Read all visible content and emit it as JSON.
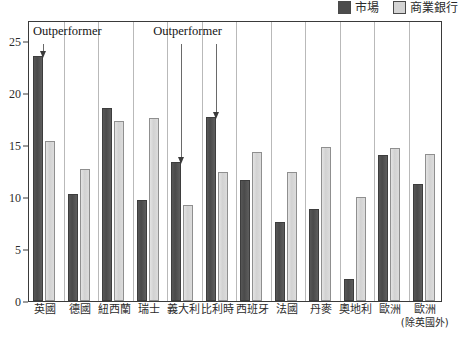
{
  "legend": {
    "items": [
      {
        "key": "market",
        "label": "市場",
        "color": "#4c4c4c"
      },
      {
        "key": "bank",
        "label": "商業銀行",
        "color": "#d4d4d4"
      }
    ]
  },
  "annotations": [
    {
      "text": "Outperformer",
      "targets": [
        "英國"
      ]
    },
    {
      "text": "Outperformer",
      "targets": [
        "義大利",
        "比利時"
      ]
    }
  ],
  "yticks": [
    "0",
    "5",
    "10",
    "15",
    "20",
    "25"
  ],
  "chart_data": {
    "type": "bar",
    "title": "",
    "subtitle": "",
    "xlabel": "",
    "ylabel": "",
    "ylim": [
      0,
      27
    ],
    "grid": false,
    "legend_position": "top-right",
    "categories": [
      "英國",
      "德國",
      "紐西蘭",
      "瑞士",
      "義大利",
      "比利時",
      "西班牙",
      "法國",
      "丹麥",
      "奧地利",
      "歐洲",
      "歐洲"
    ],
    "category_sublabels": [
      "",
      "",
      "",
      "",
      "",
      "",
      "",
      "",
      "",
      "",
      "",
      "(除英國外)"
    ],
    "series": [
      {
        "name": "市場",
        "color": "#4c4c4c",
        "values": [
          23.5,
          10.3,
          18.5,
          9.7,
          13.4,
          17.7,
          11.6,
          7.6,
          8.8,
          2.1,
          14.0,
          11.2
        ]
      },
      {
        "name": "商業銀行",
        "color": "#d4d4d4",
        "values": [
          15.4,
          12.7,
          17.3,
          17.6,
          9.2,
          12.4,
          14.3,
          12.4,
          14.8,
          10.0,
          14.7,
          14.1
        ]
      }
    ],
    "annotation_labels": [
      "Outperformer",
      "Outperformer"
    ]
  }
}
